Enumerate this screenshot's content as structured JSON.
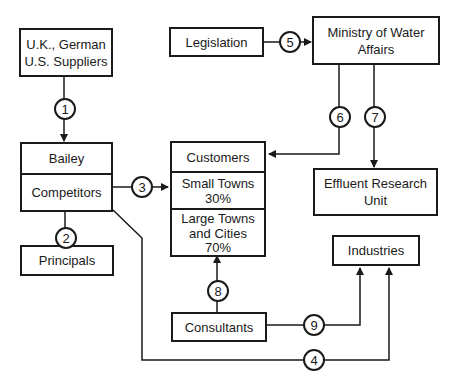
{
  "nodes": {
    "suppliers": {
      "line1": "U.K., German",
      "line2": "U.S. Suppliers"
    },
    "legislation": {
      "label": "Legislation"
    },
    "ministry": {
      "line1": "Ministry of Water",
      "line2": "Affairs"
    },
    "bailey": {
      "top": "Bailey",
      "bottom": "Competitors"
    },
    "customers": {
      "header": "Customers",
      "small_towns": {
        "label": "Small Towns",
        "share": "30%"
      },
      "large_towns": {
        "line1": "Large Towns",
        "line2": "and Cities",
        "share": "70%"
      }
    },
    "effluent": {
      "line1": "Effluent Research",
      "line2": "Unit"
    },
    "principals": {
      "label": "Principals"
    },
    "industries": {
      "label": "Industries"
    },
    "consultants": {
      "label": "Consultants"
    }
  },
  "links": [
    {
      "id": "1",
      "from": "U.K., German U.S. Suppliers",
      "to": "Bailey"
    },
    {
      "id": "2",
      "from": "Principals",
      "to": "Competitors"
    },
    {
      "id": "3",
      "from": "Competitors",
      "to": "Customers"
    },
    {
      "id": "4",
      "from": "Competitors",
      "to": "Industries"
    },
    {
      "id": "5",
      "from": "Legislation",
      "to": "Ministry of Water Affairs"
    },
    {
      "id": "6",
      "from": "Ministry of Water Affairs",
      "to": "Customers"
    },
    {
      "id": "7",
      "from": "Ministry of Water Affairs",
      "to": "Effluent Research Unit"
    },
    {
      "id": "8",
      "from": "Consultants",
      "to": "Large Towns and Cities"
    },
    {
      "id": "9",
      "from": "Consultants",
      "to": "Industries"
    }
  ]
}
